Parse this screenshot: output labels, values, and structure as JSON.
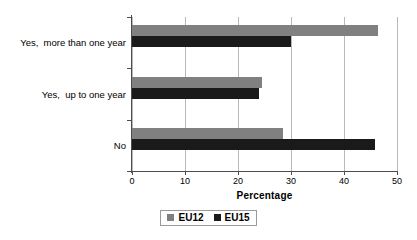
{
  "chart_data": {
    "type": "bar",
    "orientation": "horizontal",
    "title": "",
    "xlabel": "Percentage",
    "ylabel": "",
    "xlim": [
      0,
      50
    ],
    "xticks": [
      0,
      10,
      20,
      30,
      40,
      50
    ],
    "grid": "vertical",
    "legend_position": "bottom-center",
    "categories": [
      "Yes,  more than one year",
      "Yes,  up to one year",
      "No"
    ],
    "series": [
      {
        "name": "EU12",
        "color": "#808080",
        "values": [
          46.4,
          24.5,
          28.5
        ]
      },
      {
        "name": "EU15",
        "color": "#1a1a1a",
        "values": [
          30.0,
          24.0,
          45.8
        ]
      }
    ]
  },
  "axis": {
    "x_title": "Percentage",
    "tick_labels": [
      "0",
      "10",
      "20",
      "30",
      "40",
      "50"
    ]
  },
  "legend": {
    "items": [
      {
        "label": "EU12",
        "color": "#808080"
      },
      {
        "label": "EU15",
        "color": "#1a1a1a"
      }
    ]
  },
  "colors": {
    "eu12": "#808080",
    "eu15": "#1a1a1a",
    "axis": "#4d4d4d",
    "gridline": "#b9b9b9",
    "background": "#ffffff"
  }
}
